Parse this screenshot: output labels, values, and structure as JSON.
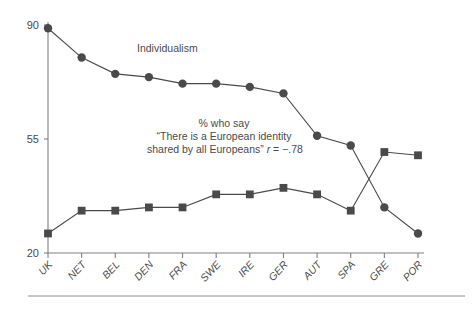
{
  "figure": {
    "background_color": "#ffffff",
    "ink_color": "#4a4a4a",
    "axis_color": "#808080",
    "rule_color": "#8a8a8a"
  },
  "annotations": {
    "series_label": "Individualism",
    "note_line1": "% who say",
    "note_line2": "“There is a European identity",
    "note_line3_prefix": "shared by all Europeans” ",
    "note_line3_stat_var": "r",
    "note_line3_stat_value": " = −.78"
  },
  "chart_data": {
    "type": "line",
    "title": "",
    "xlabel": "",
    "ylabel": "",
    "ylim": [
      20,
      90
    ],
    "yticks": [
      20,
      55,
      90
    ],
    "ytick_labels": [
      "20",
      "55",
      "90"
    ],
    "grid": false,
    "legend_position": "inline-annotation",
    "categories": [
      "UK",
      "NET",
      "BEL",
      "DEN",
      "FRA",
      "SWE",
      "IRE",
      "GER",
      "AUT",
      "SPA",
      "GRE",
      "POR"
    ],
    "series": [
      {
        "name": "Individualism",
        "marker": "circle",
        "values": [
          89,
          80,
          75,
          74,
          72,
          72,
          71,
          69,
          56,
          53,
          34,
          26
        ]
      },
      {
        "name": "% who say “There is a European identity shared by all Europeans”",
        "marker": "square",
        "values": [
          26,
          33,
          33,
          34,
          34,
          38,
          38,
          40,
          38,
          33,
          51,
          50
        ]
      }
    ],
    "correlation": "r = −.78"
  }
}
